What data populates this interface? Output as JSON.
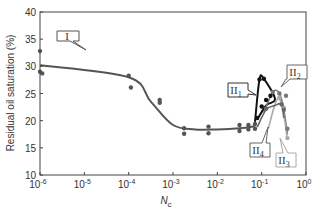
{
  "chart_data": {
    "type": "scatter",
    "title": "",
    "xlabel": "N",
    "xlabel_subscript": "c",
    "ylabel": "Residual oil saturation (%)",
    "xscale": "log",
    "xlim_exp": [
      -6,
      0
    ],
    "ylim": [
      10,
      40
    ],
    "grid": false,
    "y_ticks": [
      10,
      15,
      20,
      25,
      30,
      35,
      40
    ],
    "x_ticks": [
      {
        "base": "10",
        "exp": "-6"
      },
      {
        "base": "10",
        "exp": "-5"
      },
      {
        "base": "10",
        "exp": "-4"
      },
      {
        "base": "10",
        "exp": "-3"
      },
      {
        "base": "10",
        "exp": "-2"
      },
      {
        "base": "10",
        "exp": "-1"
      },
      {
        "base": "10",
        "exp": "0"
      }
    ],
    "series": [
      {
        "name": "I",
        "color": "#555555",
        "curve": [
          [
            -6,
            30.2
          ],
          [
            -4,
            28.0
          ],
          [
            -3.5,
            23.5
          ],
          [
            -3,
            19.2
          ],
          [
            -2.5,
            18.4
          ],
          [
            -2,
            18.4
          ],
          [
            -1.5,
            18.6
          ],
          [
            -1.15,
            19.0
          ]
        ],
        "points": [
          [
            -6,
            32.8
          ],
          [
            -6,
            29.0
          ],
          [
            -5.95,
            28.7
          ],
          [
            -4,
            28.3
          ],
          [
            -3.95,
            26.1
          ],
          [
            -3.3,
            23.8
          ],
          [
            -3.3,
            23.3
          ],
          [
            -2.75,
            18.6
          ],
          [
            -2.75,
            17.6
          ],
          [
            -2.2,
            18.9
          ],
          [
            -2.2,
            17.7
          ],
          [
            -1.5,
            19.2
          ],
          [
            -1.5,
            18.1
          ],
          [
            -1.3,
            19.2
          ],
          [
            -1.3,
            18.4
          ],
          [
            -1.15,
            19.4
          ],
          [
            -1.15,
            18.5
          ]
        ]
      },
      {
        "name": "II1",
        "color": "#111111",
        "curve": [
          [
            -1.15,
            19.8
          ],
          [
            -1.05,
            27.6
          ],
          [
            -0.95,
            27.7
          ],
          [
            -0.7,
            24.0
          ],
          [
            -0.9,
            22.8
          ],
          [
            -1.1,
            20.2
          ]
        ],
        "points": [
          [
            -1.05,
            27.6
          ],
          [
            -0.95,
            27.7
          ],
          [
            -0.9,
            23.8
          ],
          [
            -0.8,
            24.6
          ],
          [
            -1.0,
            22.6
          ],
          [
            -1.1,
            20.5
          ]
        ]
      },
      {
        "name": "II2",
        "color": "#777777",
        "curve": [
          [
            -0.95,
            21.5
          ],
          [
            -0.75,
            25.3
          ],
          [
            -0.6,
            25.0
          ],
          [
            -0.5,
            22.0
          ],
          [
            -0.42,
            17.5
          ]
        ],
        "points": [
          [
            -0.75,
            25.3
          ],
          [
            -0.6,
            25.0
          ],
          [
            -0.45,
            24.6
          ],
          [
            -0.42,
            18.5
          ]
        ]
      },
      {
        "name": "II3",
        "color": "#aaaaaa",
        "curve": [
          [
            -0.85,
            18.5
          ],
          [
            -0.7,
            23.0
          ],
          [
            -0.6,
            24.0
          ],
          [
            -0.5,
            21.0
          ],
          [
            -0.42,
            16.5
          ]
        ],
        "points": [
          [
            -0.6,
            24.2
          ],
          [
            -0.5,
            22.4
          ],
          [
            -0.42,
            16.8
          ]
        ]
      },
      {
        "name": "II4",
        "color": "#666666",
        "curve": [
          [
            -1.1,
            18.8
          ],
          [
            -0.9,
            22.0
          ],
          [
            -0.7,
            22.8
          ],
          [
            -0.55,
            23.0
          ],
          [
            -0.5,
            20.5
          ]
        ],
        "points": [
          [
            -0.9,
            22.2
          ],
          [
            -0.55,
            23.0
          ],
          [
            -0.5,
            22.0
          ]
        ]
      }
    ],
    "annotations": [
      {
        "label": "I",
        "sub": ""
      },
      {
        "label": "II",
        "sub": "1"
      },
      {
        "label": "II",
        "sub": "2"
      },
      {
        "label": "II",
        "sub": "3"
      },
      {
        "label": "II",
        "sub": "4"
      }
    ]
  },
  "axis": {
    "y_title": "Residual oil saturation (%)",
    "x_title_main": "N",
    "x_title_sub": "c"
  }
}
